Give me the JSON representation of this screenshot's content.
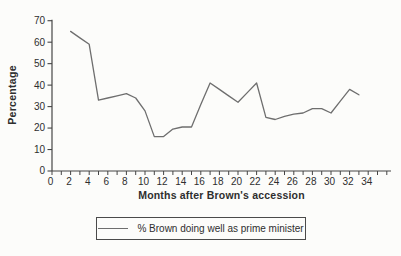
{
  "chart_data": {
    "type": "line",
    "title": "",
    "xlabel": "Months after Brown's accession",
    "ylabel": "Percentage",
    "x": [
      2,
      3,
      4,
      5,
      6,
      7,
      8,
      9,
      10,
      11,
      12,
      13,
      14,
      15,
      16,
      17,
      18,
      19,
      20,
      21,
      22,
      23,
      24,
      25,
      26,
      27,
      28,
      29,
      30,
      31,
      32,
      33
    ],
    "series": [
      {
        "name": "% Brown doing well as prime minister",
        "values": [
          65,
          62,
          59,
          33,
          34,
          35,
          36,
          34,
          28,
          16,
          16,
          19.5,
          20.5,
          20.5,
          31,
          41,
          38,
          35,
          32,
          36.5,
          41,
          25,
          24,
          25.5,
          26.5,
          27,
          29,
          29,
          27,
          32.5,
          38,
          35.5
        ]
      }
    ],
    "ylim": [
      0,
      70
    ],
    "xlim": [
      0,
      36
    ],
    "yticks": [
      0,
      10,
      20,
      30,
      40,
      50,
      60,
      70
    ],
    "xticks": [
      0,
      2,
      4,
      6,
      8,
      10,
      12,
      14,
      16,
      18,
      20,
      22,
      24,
      26,
      28,
      30,
      32,
      34
    ],
    "x_minor_tick_step": 1,
    "grid": false,
    "legend_position": "bottom-center-boxed"
  },
  "legend": {
    "label": "% Brown doing well as prime minister"
  },
  "colors": {
    "line": "#6e6e6e",
    "axis": "#454545",
    "text": "#2e2e2e",
    "background": "#fcfcfa"
  }
}
